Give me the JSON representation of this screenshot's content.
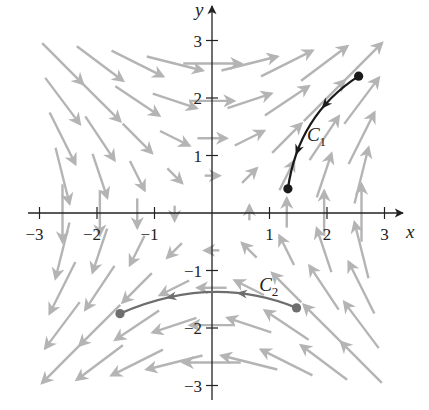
{
  "figure": {
    "origin_px": [
      212,
      213
    ],
    "unit_px": 57.5,
    "axis_color": "#222222",
    "field_color": "#b4b4b4",
    "c1_color": "#1a1a1a",
    "c2_color": "#6e6e6e"
  },
  "chart_data": {
    "type": "vector_field",
    "title": "",
    "xlabel": "x",
    "ylabel": "y",
    "xlim": [
      -3.2,
      3.4
    ],
    "ylim": [
      -3.3,
      3.4
    ],
    "x_ticks": [
      -3,
      -2,
      -1,
      1,
      2,
      3
    ],
    "y_ticks": [
      -3,
      -2,
      -1,
      1,
      2,
      3
    ],
    "x_tick_labels": [
      "−3",
      "−2",
      "−1",
      "1",
      "2",
      "3"
    ],
    "y_tick_labels": [
      "−3",
      "−2",
      "−1",
      "1",
      "2",
      "3"
    ],
    "field_description": "F(x,y) ≈ ⟨y, x⟩ (scaled); arrows point down-right in quadrant II, up-right in quadrant I, up-left in quadrant IV, down-left in quadrant III",
    "grid_step": 0.65,
    "arrow_scale": 0.26,
    "curves": [
      {
        "name": "C1",
        "label": "C",
        "subscript": "1",
        "start": [
          2.55,
          2.38
        ],
        "control": [
          1.5,
          1.7
        ],
        "end": [
          1.32,
          0.42
        ],
        "direction": "start_to_end",
        "label_pos": [
          1.65,
          1.25
        ]
      },
      {
        "name": "C2",
        "label": "C",
        "subscript": "2",
        "start": [
          1.47,
          -1.65
        ],
        "control": [
          0.0,
          -1.05
        ],
        "end": [
          -1.6,
          -1.75
        ],
        "direction": "start_to_end",
        "label_pos": [
          0.82,
          -1.35
        ]
      }
    ]
  },
  "axes": {
    "x_label": "x",
    "y_label": "y"
  },
  "labels": {
    "c1_main": "C",
    "c1_sub": "1",
    "c2_main": "C",
    "c2_sub": "2"
  }
}
